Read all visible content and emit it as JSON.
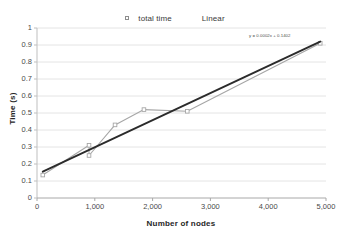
{
  "chart_data": {
    "type": "line",
    "title": "",
    "xlabel": "Number of nodes",
    "ylabel": "Time (s)",
    "xlim": [
      0,
      5000
    ],
    "ylim": [
      0,
      1
    ],
    "xticks": [
      "0",
      "1,000",
      "2,000",
      "3,000",
      "4,000",
      "5,000"
    ],
    "xtick_values": [
      0,
      1000,
      2000,
      3000,
      4000,
      5000
    ],
    "yticks": [
      "0",
      "0.1",
      "0.2",
      "0.3",
      "0.4",
      "0.5",
      "0.6",
      "0.7",
      "0.8",
      "0.9",
      "1"
    ],
    "ytick_values": [
      0,
      0.1,
      0.2,
      0.3,
      0.4,
      0.5,
      0.6,
      0.7,
      0.8,
      0.9,
      1
    ],
    "grid": "horizontal",
    "legend_position": "top-center",
    "series": [
      {
        "name": "total time",
        "color": "#a6a6a6",
        "marker": "square",
        "x": [
          100,
          900,
          900,
          1350,
          1850,
          2600,
          4900
        ],
        "y": [
          0.135,
          0.31,
          0.25,
          0.43,
          0.52,
          0.51,
          0.91
        ]
      },
      {
        "name": "Linear",
        "color": "#2b2b2b",
        "marker": "none",
        "x": [
          100,
          4900
        ],
        "y": [
          0.155,
          0.92
        ]
      }
    ],
    "annotations": [
      {
        "name": "trendline-equation",
        "text": "y = 0.0002x + 0.1402",
        "x": 4050,
        "y": 0.955
      }
    ]
  },
  "legend": {
    "items": [
      {
        "label": "total time",
        "color": "#a6a6a6",
        "marker": "square"
      },
      {
        "label": "Linear",
        "color": "#2b2b2b",
        "marker": "none"
      }
    ]
  },
  "colors": {
    "series_total_time": "#a6a6a6",
    "series_linear": "#2b2b2b",
    "gridline": "#e4e4e4",
    "axis": "#bfbfbf",
    "text": "#4a4a4a",
    "title_text": "#262626",
    "background": "#ffffff"
  }
}
